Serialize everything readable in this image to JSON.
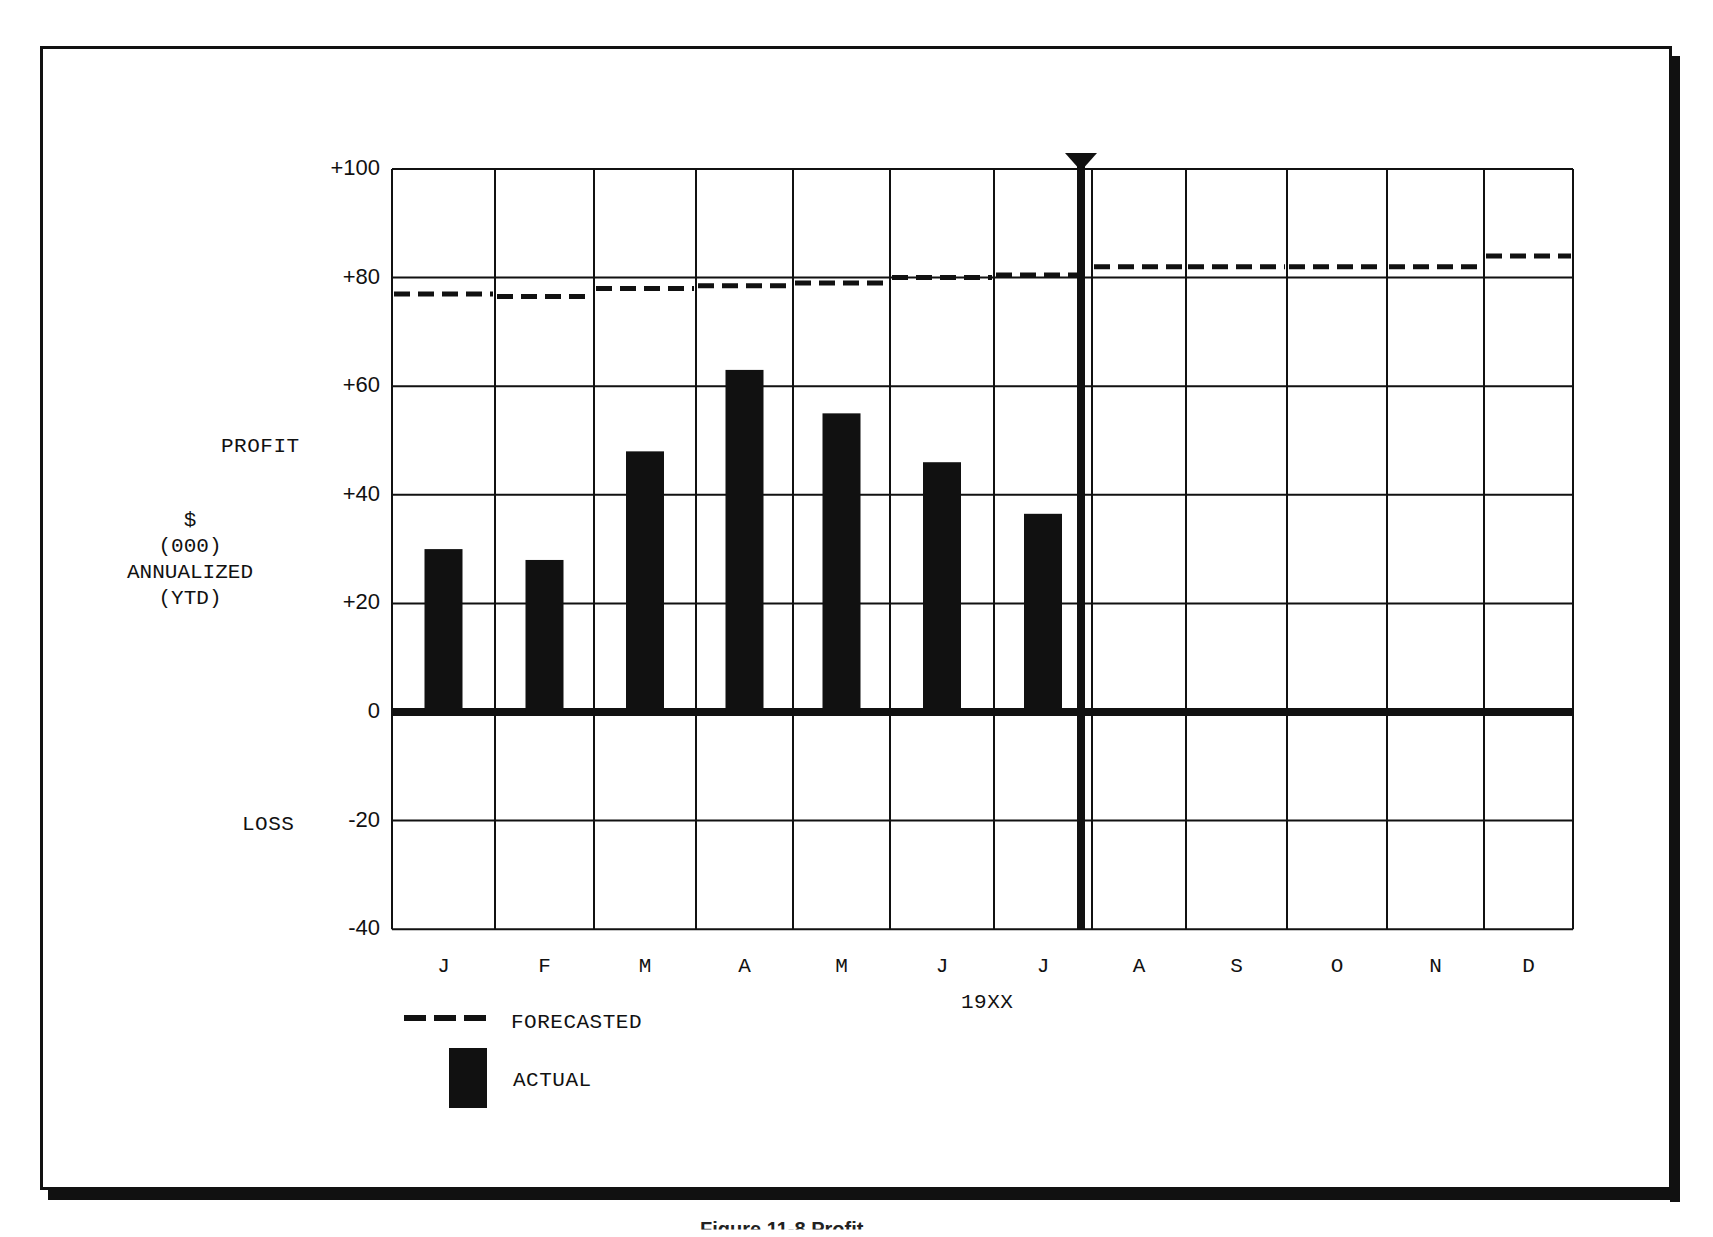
{
  "chart_data": {
    "type": "bar",
    "title": "",
    "xlabel": "19XX",
    "ylabel": "PROFIT $ (000) ANNUALIZED (YTD)",
    "y_side_labels": {
      "upper": "PROFIT",
      "lower": "LOSS"
    },
    "ylabel_lines": [
      "$",
      "(000)",
      "ANNUALIZED",
      "(YTD)"
    ],
    "ylim": [
      -40,
      100
    ],
    "yticks": [
      "+100",
      "+80",
      "+60",
      "+40",
      "+20",
      "0",
      "-20",
      "-40"
    ],
    "ytick_values": [
      100,
      80,
      60,
      40,
      20,
      0,
      -20,
      -40
    ],
    "categories": [
      "J",
      "F",
      "M",
      "A",
      "M",
      "J",
      "J",
      "A",
      "S",
      "O",
      "N",
      "D"
    ],
    "grid": true,
    "current_period_marker_after_index": 6,
    "series": [
      {
        "name": "FORECASTED",
        "style": "dashed-line",
        "values": [
          77,
          76.5,
          78,
          78.5,
          79,
          80,
          80.5,
          82,
          82,
          82,
          82,
          84
        ]
      },
      {
        "name": "ACTUAL",
        "style": "bar",
        "values": [
          30,
          28,
          48,
          63,
          55,
          46,
          36.5,
          null,
          null,
          null,
          null,
          null
        ]
      }
    ],
    "legend": {
      "position": "bottom-left",
      "entries": [
        "FORECASTED",
        "ACTUAL"
      ]
    }
  },
  "labels": {
    "profit": "PROFIT",
    "loss": "LOSS",
    "unit_lines": [
      "$",
      "(000)",
      "ANNUALIZED",
      "(YTD)"
    ],
    "year": "19XX",
    "legend_forecast": "FORECASTED",
    "legend_actual": "ACTUAL"
  },
  "caption": "Figure 11-8  Profit..."
}
